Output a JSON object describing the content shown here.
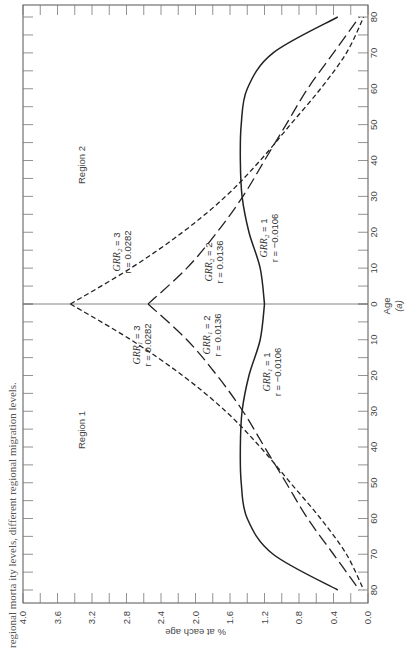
{
  "caption": "regional morta ity levels, different regional migration levels.",
  "chart_data": {
    "type": "line",
    "orientation": "rotated-90deg (page printed sideways)",
    "title": "",
    "xlabel": "% at each age",
    "ylabel": "Age (a)",
    "value_axis": {
      "ticks": [
        "4.0",
        "3.6",
        "3.2",
        "2.8",
        "2.4",
        "2.0",
        "1.6",
        "1.2",
        "0.8",
        "0.4",
        "0.0"
      ],
      "range": [
        0,
        4.0
      ]
    },
    "age_axis": {
      "ticks_region1": [
        "80",
        "70",
        "60",
        "50",
        "40",
        "30",
        "20",
        "10"
      ],
      "center": "0",
      "ticks_region2": [
        "10",
        "20",
        "30",
        "40",
        "50",
        "60",
        "70",
        "80"
      ],
      "label": "Age",
      "sublabel": "(a)"
    },
    "regions": [
      "Region 1",
      "Region 2"
    ],
    "age_points": [
      0,
      10,
      20,
      30,
      40,
      50,
      60,
      70,
      80
    ],
    "series": [
      {
        "name": "GRR = 3",
        "r": "0.0282",
        "style": "short-dash",
        "region1_values": [
          3.45,
          2.75,
          2.15,
          1.65,
          1.25,
          0.9,
          0.55,
          0.25,
          0.05
        ],
        "region2_values": [
          3.45,
          2.75,
          2.15,
          1.65,
          1.25,
          0.9,
          0.55,
          0.25,
          0.05
        ]
      },
      {
        "name": "GRR = 2",
        "r": "0.0136",
        "style": "long-dash",
        "region1_values": [
          2.55,
          2.1,
          1.75,
          1.45,
          1.2,
          0.95,
          0.7,
          0.4,
          0.1
        ],
        "region2_values": [
          2.55,
          2.1,
          1.75,
          1.45,
          1.2,
          0.95,
          0.7,
          0.4,
          0.1
        ]
      },
      {
        "name": "GRR = 1",
        "r": "−0.0106",
        "style": "solid",
        "region1_values": [
          1.2,
          1.25,
          1.38,
          1.46,
          1.48,
          1.47,
          1.4,
          1.1,
          0.35
        ],
        "region2_values": [
          1.2,
          1.25,
          1.38,
          1.46,
          1.48,
          1.47,
          1.4,
          1.1,
          0.35
        ]
      }
    ],
    "annotations": {
      "region1": [
        {
          "grr": "GRR",
          "sub": "1",
          "eq": " = 3",
          "r": "r = 0.0282"
        },
        {
          "grr": "GRR",
          "sub": "1",
          "eq": " = 2",
          "r": "r = 0.0136"
        },
        {
          "grr": "GRR",
          "sub": "1",
          "eq": " = 1",
          "r": "r = −0.0106"
        }
      ],
      "region2": [
        {
          "grr": "GRR",
          "sub": "2",
          "eq": " = 3",
          "r": "r = 0.0282"
        },
        {
          "grr": "GRR",
          "sub": "2",
          "eq": " = 2",
          "r": "r = 0.0136"
        },
        {
          "grr": "GRR",
          "sub": "2",
          "eq": " = 1",
          "r": "r = −0.0106"
        }
      ]
    },
    "grid": false,
    "legend": "inline annotations"
  }
}
